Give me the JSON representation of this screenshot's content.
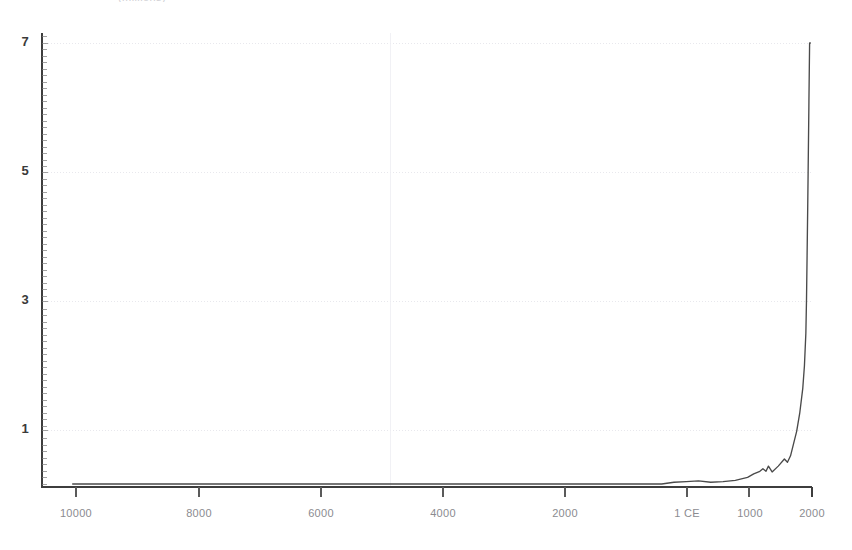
{
  "figure": {
    "cut_off_title": "(millions)",
    "background_color": "#ffffff",
    "line_color": "#4a4a4a",
    "axis_color": "#3d3d3d",
    "grid_color": "#e2e2e8",
    "tick_label_color": "#8b8b90"
  },
  "chart_data": {
    "type": "line",
    "title": "",
    "xlabel": "",
    "ylabel": "",
    "xlim": [
      -10500,
      2050
    ],
    "ylim": [
      0,
      7.35
    ],
    "grid": true,
    "legend": "none",
    "y_ticks": [
      1,
      3,
      5,
      7
    ],
    "y_tick_labels": [
      "1",
      "3",
      "5",
      "7"
    ],
    "x_ticks": [
      -10000,
      -8000,
      -6000,
      -4000,
      -2000,
      1,
      1000,
      2000
    ],
    "x_tick_labels": [
      "10000",
      "8000",
      "6000",
      "4000",
      "2000",
      "1 CE",
      "1000",
      "2000"
    ],
    "series": [
      {
        "name": "World population",
        "x": [
          -10000,
          -9500,
          -9000,
          -8500,
          -8000,
          -7500,
          -7000,
          -6500,
          -6000,
          -5500,
          -5000,
          -4500,
          -4000,
          -3500,
          -3000,
          -2500,
          -2000,
          -1500,
          -1000,
          -800,
          -500,
          -400,
          -200,
          1,
          200,
          400,
          600,
          800,
          1000,
          1100,
          1200,
          1250,
          1300,
          1340,
          1400,
          1500,
          1600,
          1650,
          1700,
          1750,
          1800,
          1850,
          1900,
          1927,
          1950,
          1960,
          1970,
          1980,
          1987,
          1999,
          2000,
          2011,
          2020,
          2023
        ],
        "values": [
          0.004,
          0.004,
          0.005,
          0.005,
          0.005,
          0.006,
          0.007,
          0.008,
          0.01,
          0.012,
          0.015,
          0.02,
          0.028,
          0.04,
          0.05,
          0.065,
          0.072,
          0.085,
          0.1,
          0.11,
          0.15,
          0.162,
          0.19,
          0.2,
          0.21,
          0.19,
          0.2,
          0.22,
          0.265,
          0.32,
          0.36,
          0.4,
          0.36,
          0.44,
          0.35,
          0.44,
          0.55,
          0.5,
          0.6,
          0.79,
          0.98,
          1.26,
          1.65,
          2.0,
          2.5,
          3.0,
          3.7,
          4.45,
          5.0,
          6.0,
          6.1,
          7.0,
          7.0,
          7.0
        ],
        "units": "billions"
      }
    ]
  }
}
